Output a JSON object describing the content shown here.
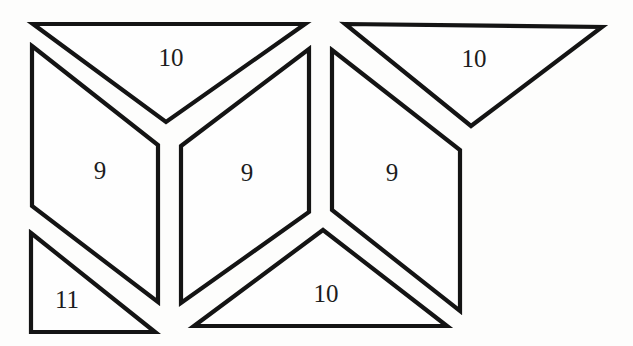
{
  "figure": {
    "width": 633,
    "height": 346,
    "background_color": "#fdfdfc",
    "piece_fill_color": "#fefefe",
    "stroke_color": "#141414",
    "stroke_width": 4.2,
    "label_color": "#1c1c1c",
    "label_font_size": 25
  },
  "shapes": [
    {
      "name": "top-left-triangle",
      "label": "10",
      "points": [
        [
          33,
          24
        ],
        [
          305,
          24
        ],
        [
          166,
          122
        ]
      ],
      "label_pos": [
        171,
        57
      ]
    },
    {
      "name": "top-right-triangle",
      "label": "10",
      "points": [
        [
          345,
          24
        ],
        [
          602,
          27
        ],
        [
          471,
          126
        ]
      ],
      "label_pos": [
        474,
        58
      ]
    },
    {
      "name": "left-parallelogram",
      "label": "9",
      "points": [
        [
          32,
          46
        ],
        [
          158,
          145
        ],
        [
          158,
          302
        ],
        [
          32,
          206
        ]
      ],
      "label_pos": [
        100,
        170
      ]
    },
    {
      "name": "middle-parallelogram",
      "label": "9",
      "points": [
        [
          181,
          146
        ],
        [
          309,
          49
        ],
        [
          309,
          212
        ],
        [
          181,
          303
        ]
      ],
      "label_pos": [
        247,
        172
      ]
    },
    {
      "name": "right-parallelogram",
      "label": "9",
      "points": [
        [
          332,
          50
        ],
        [
          460,
          150
        ],
        [
          460,
          311
        ],
        [
          332,
          210
        ]
      ],
      "label_pos": [
        392,
        172
      ]
    },
    {
      "name": "bottom-left-triangle",
      "label": "11",
      "points": [
        [
          31,
          233
        ],
        [
          155,
          332
        ],
        [
          31,
          332
        ]
      ],
      "label_pos": [
        67,
        299
      ]
    },
    {
      "name": "bottom-middle-triangle",
      "label": "10",
      "points": [
        [
          323,
          230
        ],
        [
          447,
          326
        ],
        [
          194,
          326
        ]
      ],
      "label_pos": [
        326,
        293
      ]
    }
  ]
}
